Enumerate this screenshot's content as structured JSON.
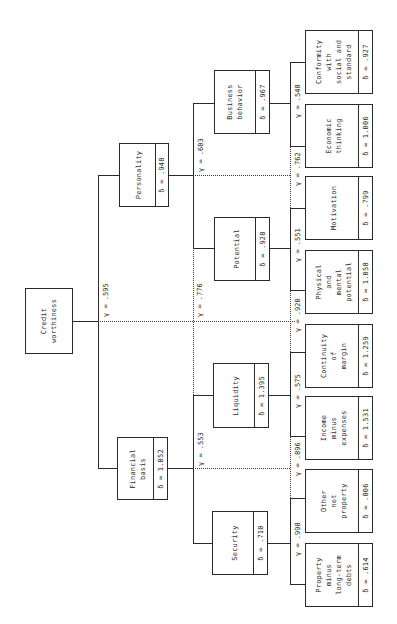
{
  "diagram": {
    "type": "hierarchical-tree",
    "orientation": "rotated-90",
    "root": {
      "label": "Credit\nworthiness",
      "gamma": "γ = .595"
    },
    "level1": [
      {
        "id": "personality",
        "label": "Personality",
        "delta": "δ = .948",
        "gamma": "γ = .603"
      },
      {
        "id": "financial-basis",
        "label": "Financial\nbasis",
        "delta": "δ = 1.052",
        "gamma": "γ = .553"
      }
    ],
    "cross_gamma": "γ = .776",
    "level2": [
      {
        "id": "business-behavior",
        "label": "Business\nbehavior",
        "delta": "δ = .967",
        "gamma": "γ = .548"
      },
      {
        "id": "potential",
        "label": "Potential",
        "delta": "δ = .928",
        "gamma": "γ = .551"
      },
      {
        "id": "liquidity",
        "label": "Liquidity",
        "delta": "δ = 1.395",
        "gamma": "γ = .575"
      },
      {
        "id": "security",
        "label": "Security",
        "delta": "δ = .710",
        "gamma": "γ = .998"
      }
    ],
    "level2_cross_gammas": {
      "business_potential": "γ = .762",
      "potential_liquidity": "γ = .920",
      "liquidity_security": "γ = .896"
    },
    "level3": [
      {
        "id": "conformity",
        "label": "Conformity\nwith\nsocial and\nstandard",
        "delta": "δ = .927"
      },
      {
        "id": "economic-thinking",
        "label": "Economic\nthinking",
        "delta": "δ = 1.006"
      },
      {
        "id": "motivation",
        "label": "Motivation",
        "delta": "δ = .799"
      },
      {
        "id": "physical-mental",
        "label": "Physical\nand\nmental\npotential",
        "delta": "δ = 1.058"
      },
      {
        "id": "continuity-margin",
        "label": "Continuity\nof\nmargin",
        "delta": "δ = 1.259"
      },
      {
        "id": "income-expenses",
        "label": "Income\nminus\nexpenses",
        "delta": "δ = 1.531"
      },
      {
        "id": "other-net-property",
        "label": "Other\nnet\nproperty",
        "delta": "δ = .806"
      },
      {
        "id": "property-debts",
        "label": "Property\nminus\nlong-term\ndebts",
        "delta": "δ = .614"
      }
    ]
  }
}
